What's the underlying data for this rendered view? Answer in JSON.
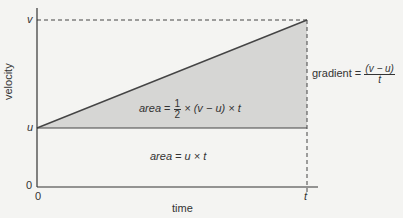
{
  "diagram": {
    "type": "velocity-time graph",
    "axes": {
      "x_label": "time",
      "y_label": "velocity",
      "x_ticks": [
        "0",
        "t"
      ],
      "y_ticks": [
        "0",
        "u",
        "v"
      ]
    },
    "annotations": {
      "triangle_area": {
        "prefix": "area",
        "eq": "=",
        "num": "1",
        "den": "2",
        "rest": "× (v − u) × t"
      },
      "rectangle_area": {
        "prefix": "area",
        "rest": "= u × t"
      },
      "gradient": {
        "prefix": "gradient =",
        "num": "(v − u)",
        "den": "t"
      }
    },
    "colors": {
      "background": "#f4f4f2",
      "shaded_triangle": "#d6d6d4",
      "line": "#333333"
    }
  }
}
